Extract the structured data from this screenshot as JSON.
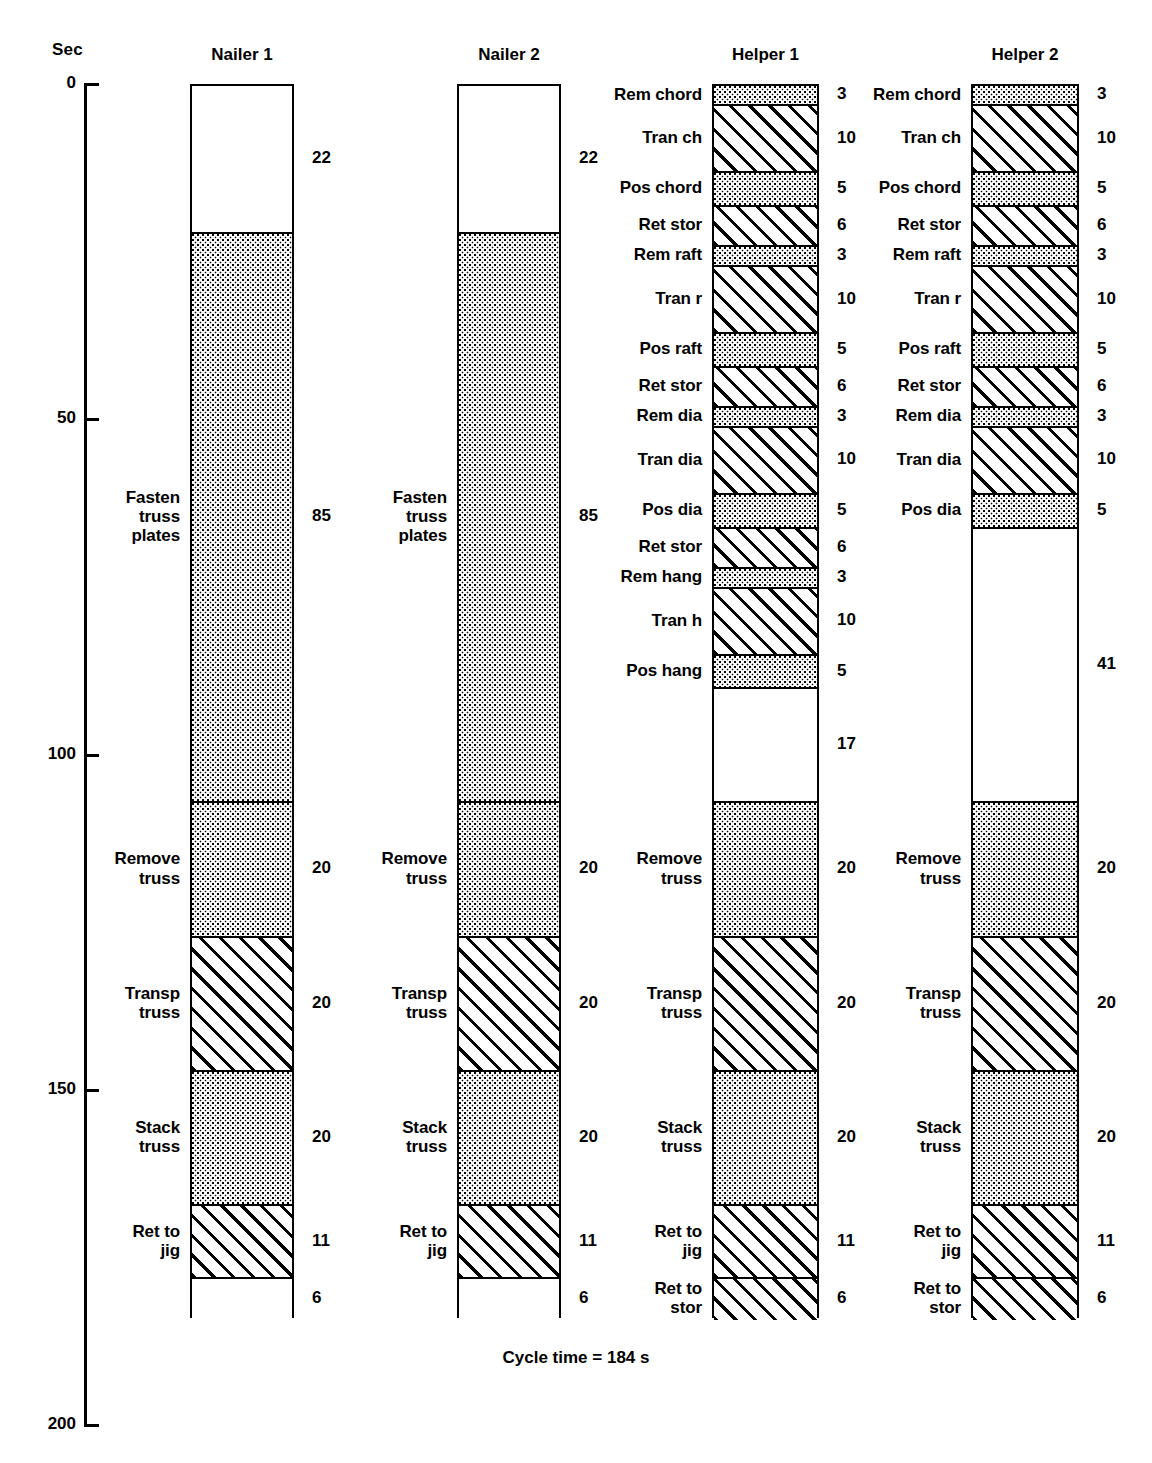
{
  "axis": {
    "title": "Sec",
    "ticks": [
      {
        "label": "0",
        "value": 0
      },
      {
        "label": "50",
        "value": 50
      },
      {
        "label": "100",
        "value": 100
      },
      {
        "label": "150",
        "value": 150
      },
      {
        "label": "200",
        "value": 200
      }
    ],
    "min": 0,
    "max": 200
  },
  "footnote": "Cycle time = 184 s",
  "chart_data": {
    "type": "bar",
    "subtitle": "Cycle time = 184 s",
    "xlabel": "",
    "ylabel": "Sec",
    "ylim": [
      0,
      200
    ],
    "y_ticks": [
      0,
      50,
      100,
      150,
      200
    ],
    "grid": false,
    "legend": null,
    "orientation": "vertical-stacked-downward",
    "units": "seconds",
    "patterns": {
      "stipple": "dotted shading",
      "hatch": "diagonal hatching",
      "none": "idle / white"
    },
    "categories": [
      "Nailer 1",
      "Nailer 2",
      "Helper 1",
      "Helper 2"
    ],
    "totals": [
      184,
      184,
      184,
      184
    ],
    "series": [
      {
        "name": "Nailer 1",
        "segments": [
          {
            "label": "",
            "value": 22,
            "pattern": "none"
          },
          {
            "label": "Fasten\ntruss\nplates",
            "value": 85,
            "pattern": "stipple"
          },
          {
            "label": "Remove\ntruss",
            "value": 20,
            "pattern": "stipple"
          },
          {
            "label": "Transp\ntruss",
            "value": 20,
            "pattern": "hatch"
          },
          {
            "label": "Stack\ntruss",
            "value": 20,
            "pattern": "stipple"
          },
          {
            "label": "Ret to\njig",
            "value": 11,
            "pattern": "hatch"
          },
          {
            "label": "",
            "value": 6,
            "pattern": "none"
          }
        ]
      },
      {
        "name": "Nailer 2",
        "segments": [
          {
            "label": "",
            "value": 22,
            "pattern": "none"
          },
          {
            "label": "Fasten\ntruss\nplates",
            "value": 85,
            "pattern": "stipple"
          },
          {
            "label": "Remove\ntruss",
            "value": 20,
            "pattern": "stipple"
          },
          {
            "label": "Transp\ntruss",
            "value": 20,
            "pattern": "hatch"
          },
          {
            "label": "Stack\ntruss",
            "value": 20,
            "pattern": "stipple"
          },
          {
            "label": "Ret to\njig",
            "value": 11,
            "pattern": "hatch"
          },
          {
            "label": "",
            "value": 6,
            "pattern": "none"
          }
        ]
      },
      {
        "name": "Helper 1",
        "segments": [
          {
            "label": "Rem chord",
            "value": 3,
            "pattern": "stipple"
          },
          {
            "label": "Tran ch",
            "value": 10,
            "pattern": "hatch"
          },
          {
            "label": "Pos chord",
            "value": 5,
            "pattern": "stipple"
          },
          {
            "label": "Ret stor",
            "value": 6,
            "pattern": "hatch"
          },
          {
            "label": "Rem raft",
            "value": 3,
            "pattern": "stipple"
          },
          {
            "label": "Tran r",
            "value": 10,
            "pattern": "hatch"
          },
          {
            "label": "Pos raft",
            "value": 5,
            "pattern": "stipple"
          },
          {
            "label": "Ret stor",
            "value": 6,
            "pattern": "hatch"
          },
          {
            "label": "Rem dia",
            "value": 3,
            "pattern": "stipple"
          },
          {
            "label": "Tran dia",
            "value": 10,
            "pattern": "hatch"
          },
          {
            "label": "Pos dia",
            "value": 5,
            "pattern": "stipple"
          },
          {
            "label": "Ret stor",
            "value": 6,
            "pattern": "hatch"
          },
          {
            "label": "Rem hang",
            "value": 3,
            "pattern": "stipple"
          },
          {
            "label": "Tran h",
            "value": 10,
            "pattern": "hatch"
          },
          {
            "label": "Pos hang",
            "value": 5,
            "pattern": "stipple"
          },
          {
            "label": "",
            "value": 17,
            "pattern": "none"
          },
          {
            "label": "Remove\ntruss",
            "value": 20,
            "pattern": "stipple"
          },
          {
            "label": "Transp\ntruss",
            "value": 20,
            "pattern": "hatch"
          },
          {
            "label": "Stack\ntruss",
            "value": 20,
            "pattern": "stipple"
          },
          {
            "label": "Ret to\njig",
            "value": 11,
            "pattern": "hatch"
          },
          {
            "label": "Ret to\nstor",
            "value": 6,
            "pattern": "hatch"
          }
        ]
      },
      {
        "name": "Helper 2",
        "segments": [
          {
            "label": "Rem chord",
            "value": 3,
            "pattern": "stipple"
          },
          {
            "label": "Tran ch",
            "value": 10,
            "pattern": "hatch"
          },
          {
            "label": "Pos chord",
            "value": 5,
            "pattern": "stipple"
          },
          {
            "label": "Ret stor",
            "value": 6,
            "pattern": "hatch"
          },
          {
            "label": "Rem raft",
            "value": 3,
            "pattern": "stipple"
          },
          {
            "label": "Tran r",
            "value": 10,
            "pattern": "hatch"
          },
          {
            "label": "Pos raft",
            "value": 5,
            "pattern": "stipple"
          },
          {
            "label": "Ret stor",
            "value": 6,
            "pattern": "hatch"
          },
          {
            "label": "Rem dia",
            "value": 3,
            "pattern": "stipple"
          },
          {
            "label": "Tran dia",
            "value": 10,
            "pattern": "hatch"
          },
          {
            "label": "Pos dia",
            "value": 5,
            "pattern": "stipple"
          },
          {
            "label": "",
            "value": 41,
            "pattern": "none"
          },
          {
            "label": "Remove\ntruss",
            "value": 20,
            "pattern": "stipple"
          },
          {
            "label": "Transp\ntruss",
            "value": 20,
            "pattern": "hatch"
          },
          {
            "label": "Stack\ntruss",
            "value": 20,
            "pattern": "stipple"
          },
          {
            "label": "Ret to\njig",
            "value": 11,
            "pattern": "hatch"
          },
          {
            "label": "Ret to\nstor",
            "value": 6,
            "pattern": "hatch"
          }
        ]
      }
    ]
  },
  "layout": {
    "columns": [
      {
        "x": 190,
        "width": 104
      },
      {
        "x": 457,
        "width": 104
      },
      {
        "x": 712,
        "width": 107
      },
      {
        "x": 971,
        "width": 108
      }
    ]
  }
}
